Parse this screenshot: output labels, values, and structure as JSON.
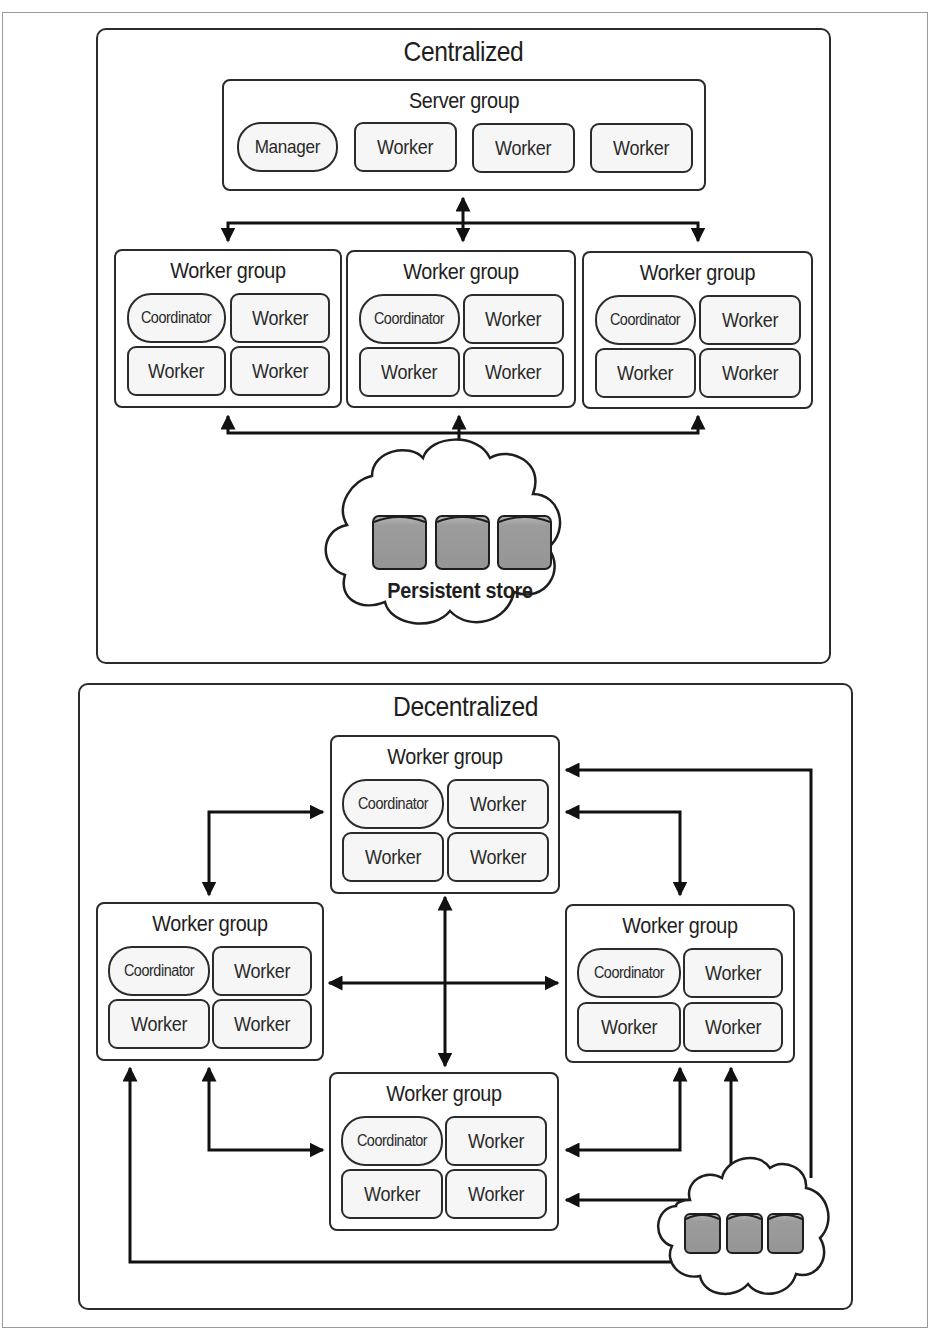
{
  "colors": {
    "stroke": "#2b2b2b",
    "node_fill": "#f6f6f6",
    "cylinder_fill": "#9c9c9c",
    "cylinder_top": "#b8b8b8",
    "cloud_fill": "#ffffff",
    "page_border": "#9a9a9a"
  },
  "centralized": {
    "title": "Centralized",
    "server_group": {
      "title": "Server group",
      "nodes": [
        "Manager",
        "Worker",
        "Worker",
        "Worker"
      ]
    },
    "worker_groups": [
      {
        "title": "Worker group",
        "nodes": [
          "Coordinator",
          "Worker",
          "Worker",
          "Worker"
        ]
      },
      {
        "title": "Worker group",
        "nodes": [
          "Coordinator",
          "Worker",
          "Worker",
          "Worker"
        ]
      },
      {
        "title": "Worker group",
        "nodes": [
          "Coordinator",
          "Worker",
          "Worker",
          "Worker"
        ]
      }
    ],
    "store": {
      "label": "Persistent store",
      "icon": "database-cylinder-icon",
      "cylinders": 3
    }
  },
  "decentralized": {
    "title": "Decentralized",
    "worker_groups": {
      "top": {
        "title": "Worker group",
        "nodes": [
          "Coordinator",
          "Worker",
          "Worker",
          "Worker"
        ]
      },
      "left": {
        "title": "Worker group",
        "nodes": [
          "Coordinator",
          "Worker",
          "Worker",
          "Worker"
        ]
      },
      "right": {
        "title": "Worker group",
        "nodes": [
          "Coordinator",
          "Worker",
          "Worker",
          "Worker"
        ]
      },
      "bottom": {
        "title": "Worker group",
        "nodes": [
          "Coordinator",
          "Worker",
          "Worker",
          "Worker"
        ]
      }
    },
    "store": {
      "icon": "database-cylinder-icon",
      "cylinders": 3
    }
  }
}
